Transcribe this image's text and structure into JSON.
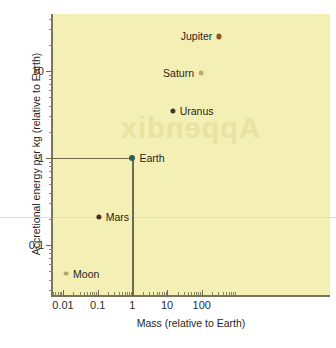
{
  "chart_data": {
    "type": "scatter",
    "title": "",
    "xlabel": "Mass (relative to Earth)",
    "ylabel": "Accretional energy per kg (relative to Earth)",
    "xscale": "log",
    "yscale": "log",
    "xlim": [
      0.004,
      600
    ],
    "ylim": [
      0.035,
      40
    ],
    "xticks": [
      "0.01",
      "0.1",
      "1",
      "10",
      "100"
    ],
    "xtick_values": [
      0.01,
      0.1,
      1,
      10,
      100
    ],
    "yticks": [
      "0.1",
      "1",
      "10"
    ],
    "ytick_values": [
      0.1,
      1,
      10
    ],
    "grid": false,
    "legend": false,
    "points": [
      {
        "name": "Jupiter",
        "x": 318,
        "y": 25,
        "label_side": "left",
        "color": "#8a5a1e",
        "radius": 2.6
      },
      {
        "name": "Saturn",
        "x": 95,
        "y": 9.5,
        "label_side": "left",
        "color": "#b8b06a",
        "radius": 2.4
      },
      {
        "name": "Uranus",
        "x": 14.5,
        "y": 3.5,
        "label_side": "right",
        "color": "#3b3a22",
        "radius": 2.6
      },
      {
        "name": "Earth",
        "x": 1,
        "y": 1,
        "label_side": "right",
        "color": "#2e5d56",
        "radius": 3.0
      },
      {
        "name": "Mars",
        "x": 0.107,
        "y": 0.21,
        "label_side": "right",
        "color": "#4a2f1a",
        "radius": 2.6
      },
      {
        "name": "Moon",
        "x": 0.0123,
        "y": 0.047,
        "label_side": "right",
        "color": "#b0a870",
        "radius": 2.4
      }
    ],
    "guide_lines": [
      {
        "name": "earth-horizontal",
        "from": [
          0.004,
          1
        ],
        "to": [
          1,
          1
        ]
      },
      {
        "name": "earth-vertical",
        "from": [
          1,
          0.035
        ],
        "to": [
          1,
          1
        ]
      }
    ],
    "annotations": [
      {
        "name": "page-watermark",
        "text": "Appendix",
        "mirrored": true
      }
    ],
    "colors": {
      "panel_background": "#f4efb4",
      "axis": "#7a7558",
      "text": "#1f1f1f",
      "watermark": "#e9e2a3"
    }
  }
}
